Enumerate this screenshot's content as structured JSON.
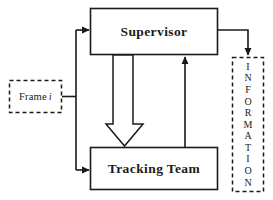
{
  "diagram": {
    "background_color": "#ffffff",
    "line_color": "#1a1a1a",
    "nodes": {
      "supervisor": {
        "label": "Supervisor",
        "border_style": "solid",
        "x": 90,
        "y": 8,
        "width": 128,
        "height": 47
      },
      "tracking_team": {
        "label": "Tracking Team",
        "border_style": "solid",
        "x": 90,
        "y": 147,
        "width": 128,
        "height": 43
      },
      "frame": {
        "label": "Frame",
        "index_label": "i",
        "border_style": "dashed",
        "x": 9,
        "y": 80,
        "width": 53,
        "height": 33
      },
      "information": {
        "label": "INFORMATION",
        "letters": [
          "I",
          "N",
          "F",
          "O",
          "R",
          "M",
          "A",
          "T",
          "I",
          "O",
          "N"
        ],
        "orientation": "vertical",
        "border_style": "dashed",
        "x": 232,
        "y": 57,
        "width": 32,
        "height": 135
      }
    },
    "edges": [
      {
        "name": "frame-to-supervisor",
        "from": "frame",
        "to": "supervisor",
        "style": "thin-arrow",
        "routing": "right-then-up-then-right"
      },
      {
        "name": "frame-to-tracking-team",
        "from": "frame",
        "to": "tracking_team",
        "style": "thin-arrow",
        "routing": "right-then-down-then-right"
      },
      {
        "name": "supervisor-to-tracking-team",
        "from": "supervisor",
        "to": "tracking_team",
        "style": "hollow-block-arrow",
        "routing": "straight-down"
      },
      {
        "name": "tracking-team-to-supervisor",
        "from": "tracking_team",
        "to": "supervisor",
        "style": "thin-arrow",
        "routing": "straight-up"
      },
      {
        "name": "supervisor-to-information",
        "from": "supervisor",
        "to": "information",
        "style": "thin-arrow",
        "routing": "right-then-down"
      }
    ]
  }
}
